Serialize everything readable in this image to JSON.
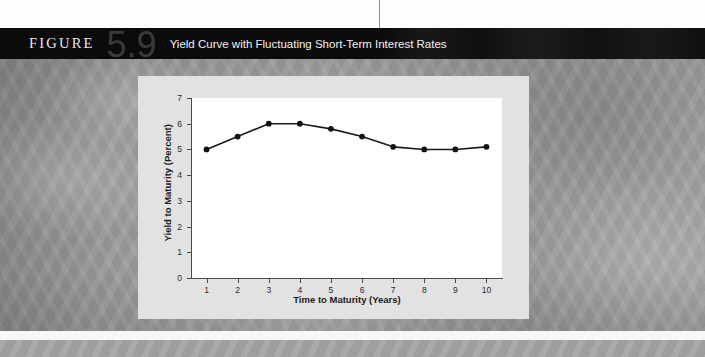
{
  "figure": {
    "label": "FIGURE",
    "number": "5.9",
    "title": "Yield Curve with Fluctuating Short-Term Interest Rates"
  },
  "colors": {
    "banner_background": "#0b0b0b",
    "banner_text": "#f2f2f2",
    "figure_number": "#3a3a3a",
    "panel_background": "#e2e2e2",
    "plot_background": "#ffffff",
    "axis": "#4a4a4a",
    "series_line": "#1a1a1a",
    "series_marker": "#111111",
    "page_background": "#9d9d9d"
  },
  "chart_data": {
    "type": "line",
    "title": "Yield Curve with Fluctuating Short-Term Interest Rates",
    "xlabel": "Time to Maturity (Years)",
    "ylabel": "Yield to Maturity (Percent)",
    "x": [
      1,
      2,
      3,
      4,
      5,
      6,
      7,
      8,
      9,
      10
    ],
    "values": [
      5.0,
      5.5,
      6.0,
      6.0,
      5.8,
      5.5,
      5.1,
      5.0,
      5.0,
      5.1
    ],
    "series": [
      {
        "name": "Yield Curve",
        "values": [
          5.0,
          5.5,
          6.0,
          6.0,
          5.8,
          5.5,
          5.1,
          5.0,
          5.0,
          5.1
        ]
      }
    ],
    "xlim": [
      0.5,
      10.5
    ],
    "ylim": [
      0,
      7
    ],
    "xticks": [
      "1",
      "2",
      "3",
      "4",
      "5",
      "6",
      "7",
      "8",
      "9",
      "10"
    ],
    "yticks": [
      "0",
      "1",
      "2",
      "3",
      "4",
      "5",
      "6",
      "7"
    ],
    "grid": false,
    "legend": false,
    "markers": "filled-circle"
  }
}
